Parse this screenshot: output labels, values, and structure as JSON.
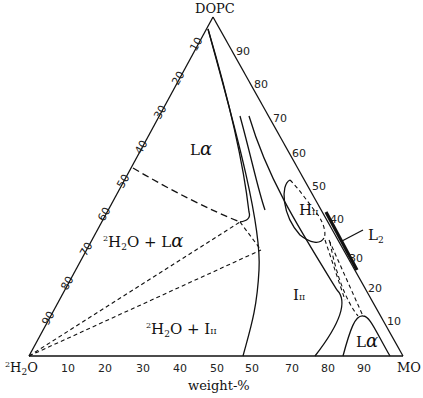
{
  "vertices": {
    "top": "DOPC",
    "left_sup": "2",
    "left": "H",
    "left_sub": "2",
    "left_end": "O",
    "right": "MO"
  },
  "axis": {
    "bottom_label": "weight-%",
    "bottom_ticks": [
      "10",
      "20",
      "30",
      "40",
      "50",
      "50",
      "70",
      "80",
      "90"
    ],
    "left_ticks": [
      "10",
      "20",
      "30",
      "40",
      "50",
      "60",
      "70",
      "80",
      "90"
    ],
    "right_ticks": [
      "90",
      "80",
      "70",
      "60",
      "50",
      "40",
      "30",
      "20",
      "10"
    ]
  },
  "regions": {
    "lalpha_top": {
      "main": "L",
      "greek": "α"
    },
    "water_lalpha": {
      "sup": "2",
      "main": "H",
      "sub": "2",
      "rest": "O + L",
      "greek": "α"
    },
    "water_i2": {
      "sup": "2",
      "main": "H",
      "sub": "2",
      "rest": "O + I",
      "roman": "II"
    },
    "i2": {
      "main": "I",
      "roman": "II"
    },
    "h2": {
      "main": "H",
      "roman": "II"
    },
    "l2": {
      "main": "L",
      "sub": "2"
    },
    "lalpha_bottom": {
      "main": "L",
      "greek": "α"
    }
  }
}
